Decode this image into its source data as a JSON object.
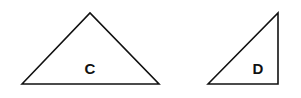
{
  "shapes": [
    {
      "label": "C",
      "type": "triangle",
      "points": [
        [
          22,
          84
        ],
        [
          90,
          13
        ],
        [
          159,
          84
        ]
      ],
      "label_pos": [
        90,
        74
      ]
    },
    {
      "label": "D",
      "type": "right-triangle",
      "points": [
        [
          208,
          84
        ],
        [
          278,
          13
        ],
        [
          278,
          84
        ]
      ],
      "label_pos": [
        258,
        74
      ]
    }
  ],
  "colors": {
    "stroke": "#111111",
    "background": "#ffffff"
  }
}
